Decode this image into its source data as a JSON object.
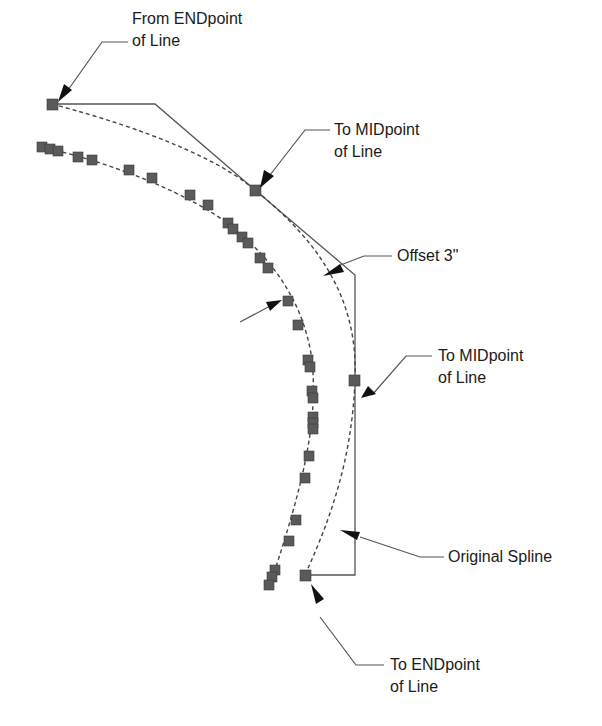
{
  "diagram": {
    "labels": {
      "from_endpoint": [
        "From ENDpoint",
        "of Line"
      ],
      "to_midpoint_1": [
        "To MIDpoint",
        "of Line"
      ],
      "offset": [
        "Offset 3\""
      ],
      "to_midpoint_2": [
        "To MIDpoint",
        "of Line"
      ],
      "original_spline": [
        "Original Spline"
      ],
      "to_endpoint": [
        "To ENDpoint",
        "of Line"
      ]
    },
    "colors": {
      "line": "#555555",
      "square": "#5a5a5a",
      "text": "#1a1a1a",
      "arrow": "#111111"
    }
  }
}
